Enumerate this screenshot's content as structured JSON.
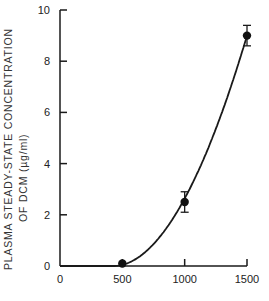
{
  "chart_data": {
    "type": "line",
    "title": "",
    "xlabel": "",
    "ylabel": "PLASMA STEADY-STATE CONCENTRATION",
    "ylabel_line2": "OF DCM (µg/ml)",
    "xlim": [
      0,
      1500
    ],
    "ylim": [
      0,
      10
    ],
    "x_ticks": [
      0,
      500,
      1000,
      1500
    ],
    "y_ticks": [
      0,
      2,
      4,
      6,
      8,
      10
    ],
    "grid": false,
    "legend": "none",
    "series": [
      {
        "name": "Plasma steady-state concentration",
        "markers": "filled-circle",
        "x": [
          500,
          1000,
          1500
        ],
        "y": [
          0.1,
          2.5,
          9.0
        ],
        "error": [
          0.0,
          0.4,
          0.4
        ],
        "curve": "smooth fitted curve through origin"
      }
    ]
  }
}
